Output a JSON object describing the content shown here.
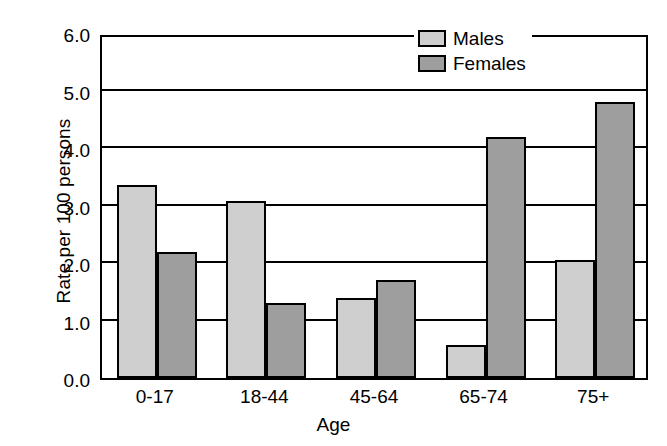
{
  "chart_data": {
    "type": "bar",
    "title": "",
    "subtitle": "",
    "xlabel": "Age",
    "ylabel": "Rate per 100 persons",
    "categories": [
      "0-17",
      "18-44",
      "45-64",
      "65-74",
      "75+"
    ],
    "series": [
      {
        "name": "Males",
        "color": "#cfcfcf",
        "values": [
          3.35,
          3.08,
          1.4,
          0.58,
          2.05
        ]
      },
      {
        "name": "Females",
        "color": "#9e9e9e",
        "values": [
          2.2,
          1.3,
          1.7,
          4.2,
          4.8
        ]
      }
    ],
    "ylim": [
      0.0,
      6.0
    ],
    "ytick_labels": [
      "0.0",
      "1.0",
      "2.0",
      "3.0",
      "4.0",
      "5.0",
      "6.0"
    ],
    "ytick_values": [
      0.0,
      1.0,
      2.0,
      3.0,
      4.0,
      5.0,
      6.0
    ],
    "grid": true,
    "grid_axis": "y",
    "legend_position": "top-right",
    "legend_entries": [
      "Males",
      "Females"
    ],
    "annotations": []
  }
}
